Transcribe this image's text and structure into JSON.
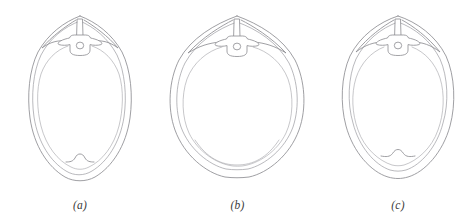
{
  "figure": {
    "background_color": "#ffffff",
    "line_color": "#8e8e92",
    "label_color": "#3a3a3a",
    "panel_count": 3
  },
  "panels": [
    {
      "id": "a",
      "label": "(a)",
      "shape_name": "anthropoid-oval-inlet",
      "description": "Long narrow oval pelvic inlet with pointed apex and prominent pubic notch",
      "inlet_width_px": 106,
      "inlet_height_px": 170
    },
    {
      "id": "b",
      "label": "(b)",
      "shape_name": "gynecoid-round-inlet",
      "description": "Wide rounded pelvic inlet with broad flat base and no pubic notch",
      "inlet_width_px": 153,
      "inlet_height_px": 168
    },
    {
      "id": "c",
      "label": "(c)",
      "shape_name": "android-heart-inlet",
      "description": "Intermediate oval pelvic inlet with rounded base and small pubic notch",
      "inlet_width_px": 122,
      "inlet_height_px": 168
    }
  ],
  "anatomy": {
    "sacral_promontory": "sacral-promontory",
    "spinous_process": "spinous-process",
    "vertebral_foramen": "vertebral-foramen",
    "transverse_process": "transverse-process",
    "pubic_notch": "pubic-notch",
    "iliopectineal_line": "iliopectineal-line"
  }
}
